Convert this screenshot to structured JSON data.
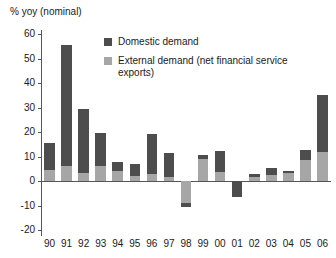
{
  "chart_data": {
    "type": "bar",
    "title": "% yoy (nominal)",
    "subtitle": "",
    "xlabel": "",
    "ylabel": "% yoy (nominal)",
    "ylim": [
      -20,
      60
    ],
    "yticks": [
      60,
      50,
      40,
      30,
      20,
      10,
      0,
      -10,
      -20
    ],
    "ytick_labels": [
      "60",
      "50",
      "40",
      "30",
      "20",
      "10",
      "0",
      "-10",
      "-20"
    ],
    "grid": false,
    "stacked": true,
    "legend_position": "top-center",
    "categories": [
      "90",
      "91",
      "92",
      "93",
      "94",
      "95",
      "96",
      "97",
      "98",
      "99",
      "00",
      "01",
      "02",
      "03",
      "04",
      "05",
      "06"
    ],
    "series": [
      {
        "name": "Domestic demand",
        "color": "#4d4d4d",
        "values": [
          11.0,
          49.5,
          26.2,
          13.5,
          3.8,
          5.0,
          16.0,
          10.0,
          -1.5,
          1.8,
          8.6,
          -6.5,
          1.5,
          3.0,
          0.6,
          4.0,
          23.0
        ]
      },
      {
        "name": "External demand (net financial service exports)",
        "color": "#a6a6a6",
        "values": [
          4.5,
          6.0,
          3.3,
          6.0,
          4.0,
          2.0,
          3.0,
          1.5,
          -9.0,
          9.0,
          3.7,
          0.0,
          1.5,
          2.3,
          3.4,
          8.7,
          12.0
        ]
      }
    ],
    "totals": [
      15.5,
      55.5,
      29.5,
      19.5,
      7.8,
      7.0,
      19.0,
      11.5,
      -10.5,
      10.8,
      12.3,
      -6.5,
      3.0,
      5.3,
      4.0,
      12.7,
      35.0
    ]
  },
  "legend": {
    "items": [
      {
        "label": "Domestic demand",
        "swatch": "dark-square-swatch"
      },
      {
        "label": "External demand (net financial service exports)",
        "swatch": "light-square-swatch"
      }
    ]
  }
}
